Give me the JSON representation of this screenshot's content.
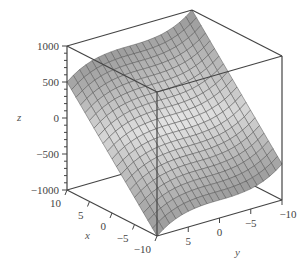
{
  "chart_data": {
    "type": "surface3d",
    "title": "",
    "xlabel": "x",
    "ylabel": "y",
    "zlabel": "z",
    "xlim": [
      -10,
      10
    ],
    "ylim": [
      -10,
      10
    ],
    "zlim": [
      -1000,
      1000
    ],
    "x_ticks": [
      10,
      5,
      0,
      -5,
      -10
    ],
    "y_ticks": [
      5,
      0,
      -5,
      -10
    ],
    "z_ticks": [
      1000,
      500,
      0,
      -500,
      -1000
    ],
    "x_tick_labels": [
      "10",
      "5",
      "0",
      "−5",
      "−10"
    ],
    "y_tick_labels": [
      "5",
      "0",
      "−5",
      "−10"
    ],
    "z_tick_labels": [
      "1000",
      "500",
      "0",
      "−500",
      "−1000"
    ],
    "corner_values": {
      "x10_y10": 500,
      "x10_ym10": 1000,
      "xm10_y10": -1000,
      "xm10_ym10": -500
    },
    "grid_lines": 21,
    "surface_color": "#b0b0b0",
    "mesh_color": "#555555",
    "box": true,
    "legend": false
  }
}
